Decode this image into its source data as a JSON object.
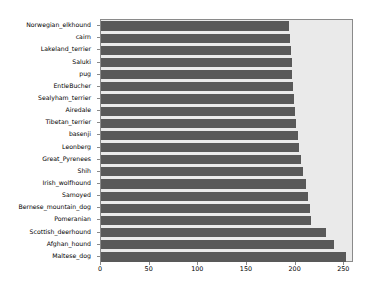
{
  "chart_data": {
    "type": "bar",
    "orientation": "horizontal",
    "title": "",
    "xlabel": "",
    "ylabel": "",
    "xlim": [
      0,
      260
    ],
    "ylim": [
      0,
      19
    ],
    "grid": false,
    "legend": null,
    "bar_color": "#595959",
    "plot_background": "#eaeaea",
    "figure_background": "#ffffff",
    "xticks": [
      0,
      50,
      100,
      150,
      200,
      250
    ],
    "xticklabels": [
      "0",
      "50",
      "100",
      "150",
      "200",
      "250"
    ],
    "categories": [
      "Norwegian_elkhound",
      "cairn",
      "Lakeland_terrier",
      "Saluki",
      "pug",
      "EntleBucher",
      "Sealyham_terrier",
      "Airedale",
      "Tibetan_terrier",
      "basenji",
      "Leonberg",
      "Great_Pyrenees",
      "Shih",
      "Irish_wolfhound",
      "Samoyed",
      "Bernese_mountain_dog",
      "Pomeranian",
      "Scottish_deerhound",
      "Afghan_hound",
      "Maltese_dog"
    ],
    "values": [
      193,
      194,
      195,
      196,
      196,
      197,
      198,
      199,
      200,
      202,
      203,
      206,
      208,
      211,
      213,
      215,
      216,
      231,
      239,
      252
    ]
  }
}
